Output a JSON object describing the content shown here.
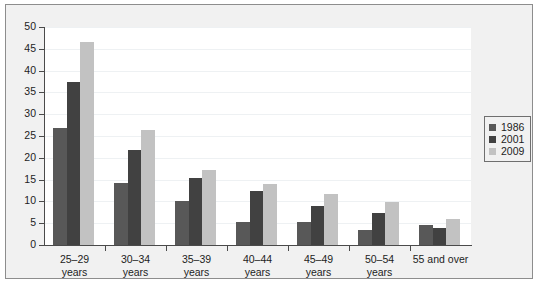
{
  "chart_data": {
    "type": "bar",
    "title": "",
    "subtitle": "",
    "xlabel": "",
    "ylabel": "",
    "ylim": [
      0,
      50
    ],
    "ytick_step": 5,
    "yticks": [
      0,
      5,
      10,
      15,
      20,
      25,
      30,
      35,
      40,
      45,
      50
    ],
    "grid": true,
    "legend_position": "right",
    "categories": [
      "25–29\nyears",
      "30–34\nyears",
      "35–39\nyears",
      "40–44\nyears",
      "45–49\nyears",
      "50–54\nyears",
      "55 and over"
    ],
    "category_lines": [
      [
        "25–29",
        "years"
      ],
      [
        "30–34",
        "years"
      ],
      [
        "35–39",
        "years"
      ],
      [
        "40–44",
        "years"
      ],
      [
        "45–49",
        "years"
      ],
      [
        "50–54",
        "years"
      ],
      [
        "55 and over"
      ]
    ],
    "series": [
      {
        "name": "1986",
        "color": "#585858",
        "values": [
          26.8,
          14.2,
          10.0,
          5.3,
          5.2,
          3.5,
          4.6
        ]
      },
      {
        "name": "2001",
        "color": "#414141",
        "values": [
          37.3,
          21.7,
          15.4,
          12.3,
          8.9,
          7.4,
          3.9
        ]
      },
      {
        "name": "2009",
        "color": "#c2c2c2",
        "values": [
          46.5,
          26.4,
          17.2,
          14.1,
          11.8,
          9.9,
          5.9
        ]
      }
    ]
  },
  "legend": {
    "entries": [
      {
        "label": "1986",
        "color": "#585858"
      },
      {
        "label": "2001",
        "color": "#414141"
      },
      {
        "label": "2009",
        "color": "#c2c2c2"
      }
    ]
  },
  "axes": {
    "y_tick_labels": [
      "0",
      "5",
      "10",
      "15",
      "20",
      "25",
      "30",
      "35",
      "40",
      "45",
      "50"
    ]
  },
  "colors": {
    "panel_background": "#f1f1f1",
    "plot_background": "#ffffff",
    "axis": "#4a4a4a",
    "gridline": "#eef1f3",
    "text": "#1d1d1d",
    "series_1986": "#585858",
    "series_2001": "#414141",
    "series_2009": "#c2c2c2"
  }
}
